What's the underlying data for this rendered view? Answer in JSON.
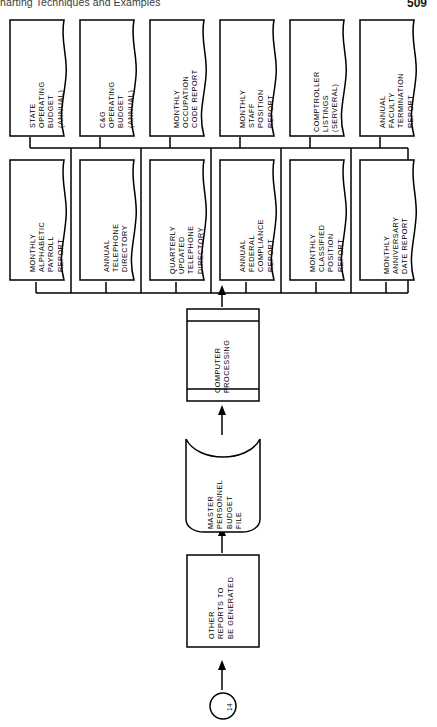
{
  "page": {
    "running_head": "harting Techniques and Examples",
    "page_number": "509"
  },
  "diagram": {
    "orientation": "rotated-90-ccw",
    "connector": {
      "name": "connector-14",
      "label": "14",
      "shape": "circle"
    },
    "nodes": [
      {
        "id": "other-reports",
        "shape": "process-rectangle",
        "lines": [
          "OTHER",
          "REPORTS TO",
          "BE GENERATED"
        ]
      },
      {
        "id": "master-file",
        "shape": "magnetic-tape",
        "lines": [
          "MASTER",
          "PERSONNEL",
          "BUDGET",
          "FILE"
        ]
      },
      {
        "id": "computer-processing",
        "shape": "predefined-process",
        "lines": [
          "COMPUTER",
          "PROCESSING"
        ]
      }
    ],
    "outputs_row_bottom": [
      {
        "id": "monthly-alphabetic-payroll-report",
        "lines": [
          "MONTHLY",
          "ALPHABETIC",
          "PAYROLL",
          "REPORT"
        ]
      },
      {
        "id": "annual-telephone-directory",
        "lines": [
          "ANNUAL",
          "TELEPHONE",
          "DIRECTORY"
        ]
      },
      {
        "id": "quarterly-updated-telephone-directory",
        "lines": [
          "QUARTERLY",
          "UPDATED",
          "TELEPHONE",
          "DIRECTORY"
        ]
      },
      {
        "id": "annual-federal-compliance-report",
        "lines": [
          "ANNUAL",
          "FEDERAL",
          "COMPLIANCE",
          "REPORT"
        ]
      },
      {
        "id": "monthly-classified-position-report",
        "lines": [
          "MONTHLY",
          "CLASSIFIED",
          "POSITION",
          "REPORT"
        ]
      },
      {
        "id": "monthly-anniversary-date-report",
        "lines": [
          "MONTHLY",
          "ANNIVERSARY",
          "DATE REPORT"
        ]
      }
    ],
    "outputs_row_top": [
      {
        "id": "state-operating-budget",
        "lines": [
          "STATE",
          "OPERATING",
          "BUDGET",
          "(ANNUAL)"
        ]
      },
      {
        "id": "cg-operating-budget",
        "lines": [
          "C&G",
          "OPERATING",
          "BUDGET",
          "(ANNUAL)"
        ]
      },
      {
        "id": "monthly-occupation-code-report",
        "lines": [
          "MONTHLY",
          "OCCUPATION",
          "CODE REPORT"
        ]
      },
      {
        "id": "monthly-staff-position-report",
        "lines": [
          "MONTHLY",
          "STAFF",
          "POSITION",
          "REPORT"
        ]
      },
      {
        "id": "comptroller-listings",
        "lines": [
          "COMPTROLLER",
          "LISTINGS",
          "(SERVERAL)"
        ]
      },
      {
        "id": "annual-faculty-termination-report",
        "lines": [
          "ANNUAL",
          "FACULTY",
          "TERMINATION",
          "REPORT"
        ]
      }
    ]
  }
}
